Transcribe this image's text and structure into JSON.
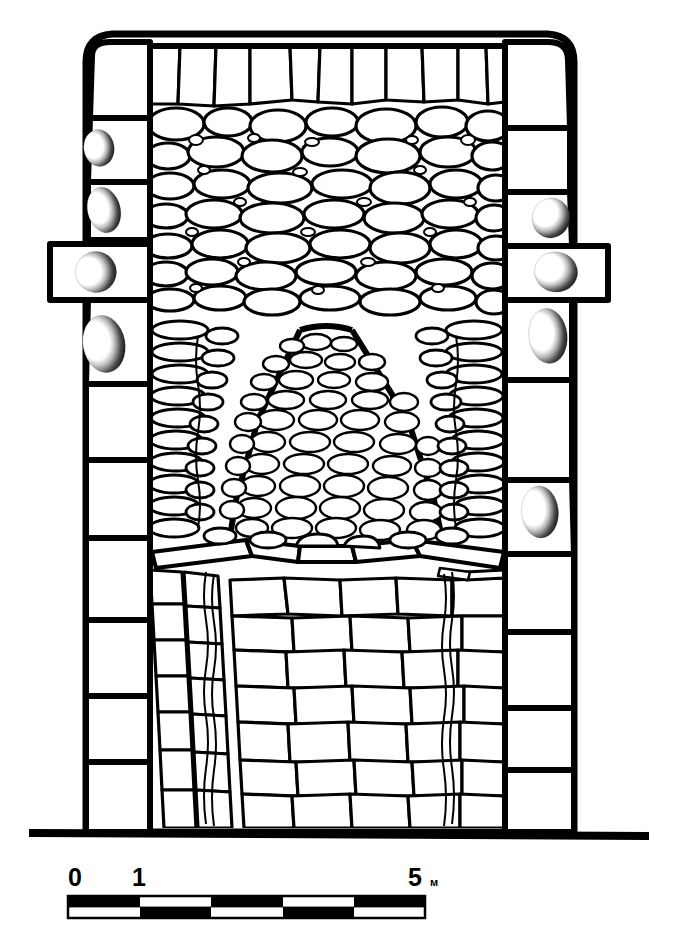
{
  "figure": {
    "kind": "archaeological-elevation-drawing",
    "line_color": "#000000",
    "background_color": "#ffffff"
  },
  "scale_bar": {
    "labels": [
      "0",
      "1",
      "5"
    ],
    "unit": "м",
    "segments": 5,
    "segment_span_m": 1,
    "total_m": 5,
    "pattern": "checkerboard",
    "fill_dark": "#000000",
    "fill_light": "#ffffff"
  },
  "structure": {
    "ground_line_label": "ground-line",
    "left_quoin_blocks": 10,
    "right_quoin_blocks": 10,
    "cupmark_count_left": 4,
    "cupmark_count_right": 4,
    "protruding_blocks": 2
  },
  "geometry": {
    "outline": "M 86 60 Q 86 36 110 34 L 548 34 Q 574 36 574 62 L 574 832 L 86 832 Z",
    "ground_line": "M 33 834 L 645 834",
    "left_wall_inner_x": 150,
    "right_wall_inner_x": 505,
    "top_y": 34,
    "base_y": 832
  },
  "left_column": {
    "blocks": [
      {
        "y": 40,
        "h": 78,
        "cup": false,
        "protrude": false
      },
      {
        "y": 120,
        "h": 62,
        "cup": true,
        "protrude": false
      },
      {
        "y": 184,
        "h": 58,
        "cup": true,
        "protrude": false
      },
      {
        "y": 244,
        "h": 56,
        "cup": true,
        "protrude": true
      },
      {
        "y": 302,
        "h": 82,
        "cup": true,
        "protrude": false
      },
      {
        "y": 386,
        "h": 74,
        "cup": false,
        "protrude": false
      },
      {
        "y": 462,
        "h": 76,
        "cup": false,
        "protrude": false
      },
      {
        "y": 540,
        "h": 80,
        "cup": false,
        "protrude": false
      },
      {
        "y": 622,
        "h": 74,
        "cup": false,
        "protrude": false
      },
      {
        "y": 698,
        "h": 62,
        "cup": false,
        "protrude": false
      },
      {
        "y": 762,
        "h": 70,
        "cup": false,
        "protrude": false
      }
    ]
  },
  "right_column": {
    "blocks": [
      {
        "y": 40,
        "h": 88,
        "cup": false,
        "protrude": false
      },
      {
        "y": 130,
        "h": 62,
        "cup": false,
        "protrude": false
      },
      {
        "y": 194,
        "h": 52,
        "cup": true,
        "protrude": false
      },
      {
        "y": 248,
        "h": 52,
        "cup": true,
        "protrude": true
      },
      {
        "y": 302,
        "h": 78,
        "cup": true,
        "protrude": false
      },
      {
        "y": 382,
        "h": 98,
        "cup": false,
        "protrude": false
      },
      {
        "y": 482,
        "h": 72,
        "cup": true,
        "protrude": false
      },
      {
        "y": 556,
        "h": 76,
        "cup": false,
        "protrude": false
      },
      {
        "y": 634,
        "h": 74,
        "cup": false,
        "protrude": false
      },
      {
        "y": 710,
        "h": 60,
        "cup": false,
        "protrude": false
      },
      {
        "y": 772,
        "h": 60,
        "cup": false,
        "protrude": false
      }
    ]
  }
}
